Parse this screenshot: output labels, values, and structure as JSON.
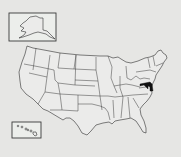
{
  "map": {
    "title": "United States locator map",
    "highlighted_state": "Maryland",
    "highlight_color": "#111111",
    "base_color": "#ebebea",
    "background_color": "#e6e6e4",
    "insets": [
      "Alaska",
      "Hawaii"
    ]
  }
}
